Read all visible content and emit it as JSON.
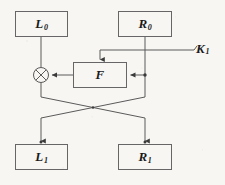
{
  "diagram": {
    "type": "block-diagram",
    "colors": {
      "background": "#f7f6f3",
      "stroke": "#555555",
      "text": "#1a1a1a"
    },
    "nodes": [
      {
        "id": "L0",
        "kind": "box",
        "label_main": "L",
        "label_sub": "0",
        "x": 15,
        "y": 11,
        "w": 53,
        "h": 26
      },
      {
        "id": "R0",
        "kind": "box",
        "label_main": "R",
        "label_sub": "0",
        "x": 118,
        "y": 11,
        "w": 54,
        "h": 26
      },
      {
        "id": "F",
        "kind": "box",
        "label_main": "F",
        "label_sub": "",
        "x": 73,
        "y": 62,
        "w": 54,
        "h": 26
      },
      {
        "id": "XOR",
        "kind": "circle",
        "label_main": "",
        "label_sub": "",
        "cx": 41,
        "cy": 75,
        "r": 7.5
      },
      {
        "id": "L1",
        "kind": "box",
        "label_main": "L",
        "label_sub": "1",
        "x": 15,
        "y": 144,
        "w": 53,
        "h": 26
      },
      {
        "id": "R1",
        "kind": "box",
        "label_main": "R",
        "label_sub": "1",
        "x": 118,
        "y": 144,
        "w": 54,
        "h": 26
      },
      {
        "id": "K1",
        "kind": "text",
        "label_main": "K",
        "label_sub": "1",
        "x": 196,
        "y": 41,
        "w": 22,
        "h": 15
      }
    ],
    "edges": [
      {
        "id": "l0-to-xor",
        "from": "L0",
        "to": "XOR",
        "arrow": false
      },
      {
        "id": "k1-to-f",
        "from": "K1",
        "to": "F",
        "arrow": true
      },
      {
        "id": "r0-to-f",
        "from": "R0",
        "to": "F",
        "arrow": true
      },
      {
        "id": "f-to-xor",
        "from": "F",
        "to": "XOR",
        "arrow": true
      },
      {
        "id": "xor-to-r1",
        "from": "XOR",
        "to": "R1",
        "arrow": true
      },
      {
        "id": "r0-to-l1",
        "from": "R0",
        "to": "L1",
        "arrow": true
      }
    ]
  }
}
